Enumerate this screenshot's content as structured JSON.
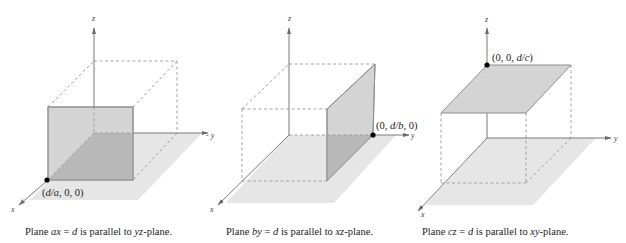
{
  "panels": [
    {
      "id": "panel-yz",
      "axes": {
        "x": "x",
        "y": "y",
        "z": "z"
      },
      "point_label_pre": "(",
      "point_label_var": "d/a",
      "point_label_post": ", 0, 0)",
      "caption": {
        "pre": "Plane ",
        "eq_var": "ax",
        "eq_mid": " = ",
        "eq_d": "d",
        "mid": " is parallel to ",
        "plane": "yz",
        "post": "-plane."
      }
    },
    {
      "id": "panel-xz",
      "axes": {
        "x": "x",
        "y": "y",
        "z": "z",
        "y_neg": "y"
      },
      "point_label_pre": "(0, ",
      "point_label_var": "d/b",
      "point_label_post": ", 0)",
      "caption": {
        "pre": "Plane ",
        "eq_var": "by",
        "eq_mid": " = ",
        "eq_d": "d",
        "mid": " is parallel to ",
        "plane": "xz",
        "post": "-plane."
      }
    },
    {
      "id": "panel-xy",
      "axes": {
        "x": "x",
        "y": "y",
        "z": "z"
      },
      "point_label_pre": "(0, 0, ",
      "point_label_var": "d/c",
      "point_label_post": ")",
      "caption": {
        "pre": "Plane ",
        "eq_var": "cz",
        "eq_mid": " = ",
        "eq_d": "d",
        "mid": " is parallel to ",
        "plane": "xy",
        "post": "-plane."
      }
    }
  ],
  "colors": {
    "floor": "#e6e6e6",
    "plane": "#d4d4d4",
    "plane_shadow": "#b8b8b8",
    "axis": "#7a7a7a",
    "point": "#000000"
  }
}
